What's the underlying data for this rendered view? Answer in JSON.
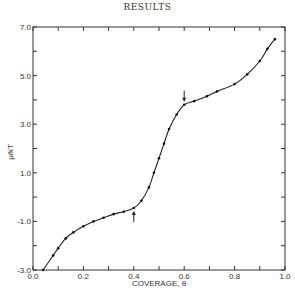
{
  "page": {
    "heading": "RESULTS"
  },
  "chart_data": {
    "type": "line",
    "title": "",
    "xlabel": "COVERAGE, θ",
    "ylabel": "μ/kT",
    "xlim": [
      0.0,
      1.0
    ],
    "ylim": [
      -3.0,
      7.0
    ],
    "grid": false,
    "legend": null,
    "x_tick_labels": [
      "0.0",
      "0.2",
      "0.4",
      "0.6",
      "0.8",
      "1.0"
    ],
    "x_ticks": [
      0.0,
      0.1,
      0.2,
      0.3,
      0.4,
      0.5,
      0.6,
      0.7,
      0.8,
      0.9,
      1.0
    ],
    "y_tick_labels": [
      "-3.0",
      "-1.0",
      "1.0",
      "3.0",
      "5.0",
      "7.0"
    ],
    "y_ticks": [
      -3,
      -2,
      -1,
      0,
      1,
      2,
      3,
      4,
      5,
      6,
      7
    ],
    "series": [
      {
        "name": "μ/kT vs coverage",
        "x": [
          0.04,
          0.08,
          0.1,
          0.13,
          0.16,
          0.2,
          0.24,
          0.28,
          0.32,
          0.36,
          0.4,
          0.43,
          0.46,
          0.48,
          0.5,
          0.52,
          0.54,
          0.57,
          0.6,
          0.64,
          0.69,
          0.73,
          0.8,
          0.85,
          0.9,
          0.93,
          0.96
        ],
        "y": [
          -3.0,
          -2.4,
          -2.1,
          -1.7,
          -1.45,
          -1.2,
          -1.0,
          -0.85,
          -0.7,
          -0.6,
          -0.45,
          -0.15,
          0.4,
          1.0,
          1.6,
          2.2,
          2.8,
          3.4,
          3.8,
          3.95,
          4.15,
          4.35,
          4.65,
          5.05,
          5.6,
          6.1,
          6.5
        ]
      }
    ],
    "annotations": [
      {
        "type": "arrow",
        "direction": "up",
        "x": 0.4,
        "y": -0.45,
        "text": ""
      },
      {
        "type": "arrow",
        "direction": "down",
        "x": 0.6,
        "y": 3.8,
        "text": ""
      }
    ]
  }
}
